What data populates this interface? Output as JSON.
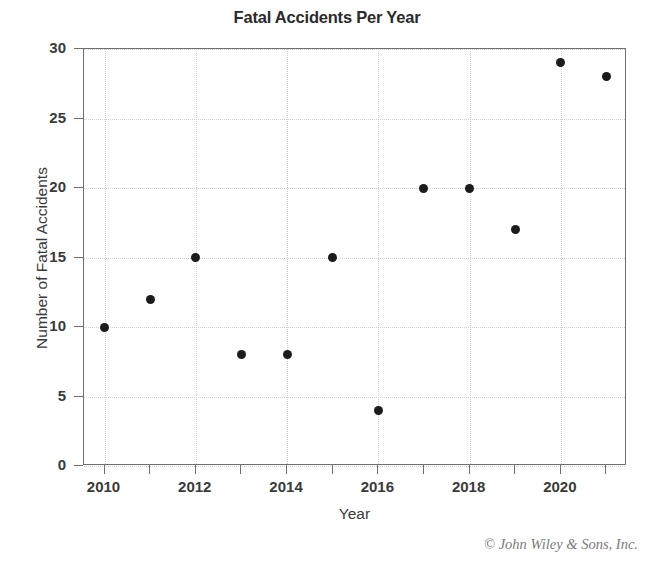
{
  "chart_data": {
    "type": "scatter",
    "title": "Fatal Accidents Per Year",
    "xlabel": "Year",
    "ylabel": "Number of Fatal Accidents",
    "x": [
      2010,
      2011,
      2012,
      2013,
      2014,
      2015,
      2016,
      2017,
      2018,
      2019,
      2020,
      2021
    ],
    "values": [
      10,
      12,
      15,
      8,
      8,
      15,
      4,
      20,
      20,
      17,
      29,
      28
    ],
    "series": [
      {
        "name": "Fatal Accidents",
        "values": [
          10,
          12,
          15,
          8,
          8,
          15,
          4,
          20,
          20,
          17,
          29,
          28
        ]
      }
    ],
    "points": [
      {
        "x": 2010,
        "y": 10
      },
      {
        "x": 2011,
        "y": 12
      },
      {
        "x": 2012,
        "y": 15
      },
      {
        "x": 2013,
        "y": 8
      },
      {
        "x": 2014,
        "y": 8
      },
      {
        "x": 2015,
        "y": 15
      },
      {
        "x": 2016,
        "y": 4
      },
      {
        "x": 2017,
        "y": 20
      },
      {
        "x": 2018,
        "y": 20
      },
      {
        "x": 2019,
        "y": 17
      },
      {
        "x": 2020,
        "y": 29
      },
      {
        "x": 2021,
        "y": 28
      }
    ],
    "xlim": [
      2009.55,
      2021.45
    ],
    "ylim": [
      0,
      30
    ],
    "xtick_values": [
      2010,
      2011,
      2012,
      2013,
      2014,
      2015,
      2016,
      2017,
      2018,
      2019,
      2020,
      2021
    ],
    "xtick_labels": [
      "2010",
      "",
      "2012",
      "",
      "2014",
      "",
      "2016",
      "",
      "2018",
      "",
      "2020",
      ""
    ],
    "ytick_values": [
      0,
      5,
      10,
      15,
      20,
      25,
      30
    ],
    "ytick_labels": [
      "0",
      "5",
      "10",
      "15",
      "20",
      "25",
      "30"
    ],
    "grid": true,
    "grid_style": "dotted",
    "grid_color": "#cfcfcf",
    "xgrid_values": [
      2010,
      2012,
      2014,
      2016,
      2018,
      2020
    ],
    "ygrid_values": [
      0,
      5,
      10,
      15,
      20,
      25,
      30
    ],
    "legend": null,
    "marker_color": "#1c1c1c",
    "marker_size": 9,
    "frame_color": "#6f6f6f"
  },
  "credit": {
    "text": "© John Wiley & Sons, Inc."
  }
}
